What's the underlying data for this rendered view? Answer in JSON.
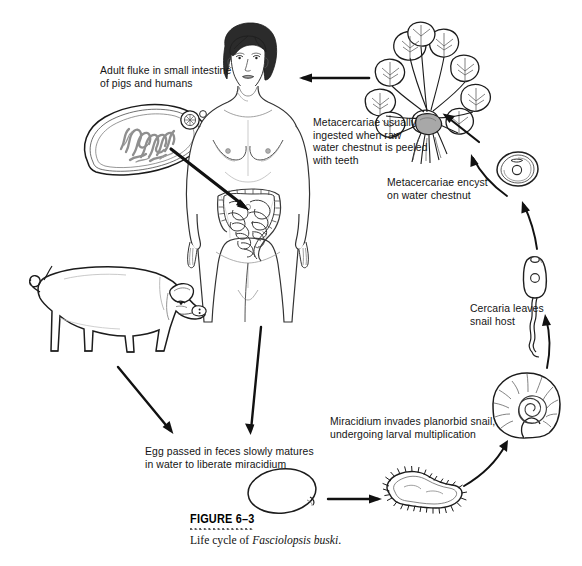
{
  "figure": {
    "number_label": "FIGURE 6–3",
    "caption_prefix": "Life cycle of ",
    "caption_species": "Fasciolopsis buski",
    "caption_suffix": "."
  },
  "labels": {
    "adult_fluke": "Adult fluke in small intestine\nof pigs and humans",
    "metacercariae_ingested": "Metacercariae usually\ningested when raw\nwater chestnut is peeled\nwith teeth",
    "metacercariae_encyst": "Metacercariae encyst\non water chestnut",
    "cercaria_leaves": "Cercaria leaves\nsnail host",
    "miracidium_invades": "Miracidium invades planorbid snail,\nundergoing larval multiplication",
    "egg_passed": "Egg passed in feces slowly matures\nin water to liberate miracidium"
  },
  "organisms": {
    "adult_fluke": "adult-fluke",
    "human": "human-host",
    "pig": "pig-host",
    "water_chestnut": "water-chestnut-plant",
    "metacercaria_cyst": "metacercaria-cyst",
    "cercaria": "cercaria",
    "snail": "planorbid-snail",
    "miracidium": "miracidium",
    "egg": "fluke-egg"
  },
  "colors": {
    "ink": "#141414",
    "line": "#1a1a1a",
    "fluke_interior": "#8f8f8f",
    "hair": "#2b2b2b",
    "skin_shade": "#d8d8d8",
    "background": "#ffffff"
  }
}
